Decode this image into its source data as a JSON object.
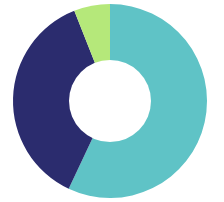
{
  "chart_data": {
    "type": "pie",
    "variant": "donut",
    "title": "",
    "subtitle": "",
    "xlabel": "",
    "ylabel": "",
    "grid": false,
    "legend": "none",
    "labels_visible": false,
    "start_angle_deg": 0,
    "direction": "clockwise",
    "categories": [
      "Teal segment",
      "Navy segment",
      "Green segment"
    ],
    "values": [
      57,
      37,
      6
    ],
    "units": "percent",
    "total": 100,
    "slices": [
      {
        "name": "Teal segment",
        "value": 57,
        "color": "#5FC3C6",
        "start_deg": 0,
        "end_deg": 205.2
      },
      {
        "name": "Navy segment",
        "value": 37,
        "color": "#2B2C6E",
        "start_deg": 205.2,
        "end_deg": 338.4
      },
      {
        "name": "Green segment",
        "value": 6,
        "color": "#B5E87A",
        "start_deg": 338.4,
        "end_deg": 360
      }
    ],
    "geometry": {
      "center_x": 110,
      "center_y": 101,
      "outer_radius": 97,
      "inner_radius": 41
    },
    "colors": {
      "teal": "#5FC3C6",
      "navy": "#2B2C6E",
      "green": "#B5E87A",
      "background": "#ffffff",
      "hole": "#ffffff"
    }
  }
}
